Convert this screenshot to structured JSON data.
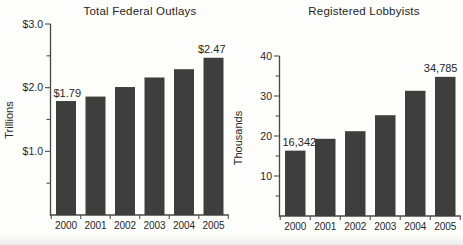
{
  "figure": {
    "background_color": "#fdfdfb",
    "text_color": "#262626",
    "axis_color": "#474747"
  },
  "chart_data": [
    {
      "type": "bar",
      "title": "Total Federal Outlays",
      "ylabel": "Trillions",
      "xlabel": "",
      "unit": "trillions of dollars",
      "categories": [
        "2000",
        "2001",
        "2002",
        "2003",
        "2004",
        "2005"
      ],
      "values": [
        1.79,
        1.86,
        2.01,
        2.16,
        2.29,
        2.47
      ],
      "value_labels": {
        "first": "$1.79",
        "last": "$2.47"
      },
      "ylim": [
        0,
        3.0
      ],
      "yticks": {
        "values": [
          1.0,
          2.0,
          3.0
        ],
        "labels": [
          "$1.0",
          "$2.0",
          "$3.0"
        ],
        "minor": [
          0.5,
          1.5,
          2.5
        ]
      },
      "grid": false,
      "legend": "none",
      "bar_color": "#3e3e3e"
    },
    {
      "type": "bar",
      "title": "Registered Lobbyists",
      "ylabel": "Thousands",
      "xlabel": "",
      "unit": "thousands of lobbyists",
      "categories": [
        "2000",
        "2001",
        "2002",
        "2003",
        "2004",
        "2005"
      ],
      "values": [
        16.342,
        19.3,
        21.2,
        25.2,
        31.3,
        34.785
      ],
      "value_labels": {
        "first": "16,342",
        "last": "34,785"
      },
      "ylim": [
        0,
        40
      ],
      "yticks": {
        "values": [
          10,
          20,
          30,
          40
        ],
        "labels": [
          "10",
          "20",
          "30",
          "40"
        ],
        "minor": [
          5,
          15,
          25,
          35
        ]
      },
      "grid": false,
      "legend": "none",
      "bar_color": "#3e3e3e"
    }
  ]
}
